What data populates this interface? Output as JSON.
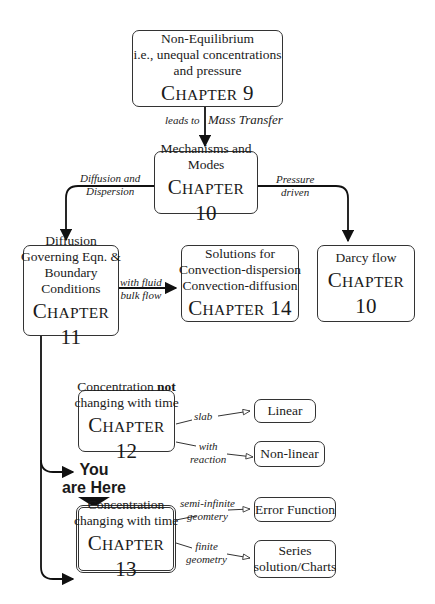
{
  "nodes": {
    "ch9": {
      "lines": [
        "Non-Equilibrium",
        "i.e., unequal concentrations",
        "and pressure"
      ],
      "chapter_prefix": "C",
      "chapter_word": "HAPTER",
      "chapter_num": "9"
    },
    "ch10_modes": {
      "lines": [
        "Mechanisms and",
        "Modes"
      ],
      "chapter_prefix": "C",
      "chapter_word": "HAPTER",
      "chapter_num": "10"
    },
    "ch11": {
      "lines": [
        "Diffusion",
        "Governing Eqn. &",
        "Boundary",
        "Conditions"
      ],
      "chapter_prefix": "C",
      "chapter_word": "HAPTER",
      "chapter_num": "11"
    },
    "ch14": {
      "lines": [
        "Solutions for",
        "Convection-dispersion",
        "Convection-diffusion"
      ],
      "chapter_prefix": "C",
      "chapter_word": "HAPTER",
      "chapter_num": "14"
    },
    "ch10_darcy": {
      "lines": [
        "Darcy flow"
      ],
      "chapter_prefix": "C",
      "chapter_word": "HAPTER",
      "chapter_num": "10"
    },
    "ch12": {
      "line1_pre": "Concentration ",
      "line1_bold": "not",
      "line2": "changing with time",
      "chapter_prefix": "C",
      "chapter_word": "HAPTER",
      "chapter_num": "12"
    },
    "ch13": {
      "lines": [
        "Concentration",
        "changing with time"
      ],
      "chapter_prefix": "C",
      "chapter_word": "HAPTER",
      "chapter_num": "13"
    },
    "linear": {
      "label": "Linear"
    },
    "nonlinear": {
      "label": "Non-linear"
    },
    "errorfn": {
      "label": "Error Function"
    },
    "series": {
      "lines": [
        "Series",
        "solution/Charts"
      ]
    }
  },
  "edges": {
    "leads_to_a": "leads to",
    "leads_to_b": "Mass Transfer",
    "diffusion": [
      "Diffusion and",
      "Dispersion"
    ],
    "pressure": [
      "Pressure",
      "driven"
    ],
    "fluid": [
      "with fluid",
      "bulk flow"
    ],
    "slab": "slab",
    "reaction": [
      "with",
      "reaction"
    ],
    "semi": [
      "semi-infinite",
      "geomtery"
    ],
    "finite": [
      "finite",
      "geometry"
    ]
  },
  "marker": {
    "lines": [
      "You",
      "are Here"
    ]
  },
  "colors": {
    "ink": "#1a1a1a",
    "background": "#ffffff"
  }
}
